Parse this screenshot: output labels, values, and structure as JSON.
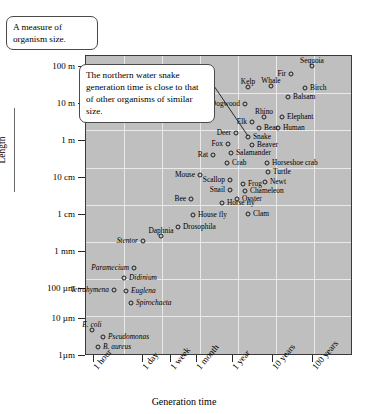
{
  "callouts": {
    "size_note": "A measure of organism size.",
    "snake_note": "The northern water snake generation time is close to that of other organisms of similar size."
  },
  "chart_data": {
    "type": "scatter",
    "title": "",
    "xlabel": "Generation time",
    "ylabel": "Length",
    "grid": true,
    "legend": "none",
    "xscale": "log",
    "yscale": "log",
    "xticks": [
      "1 hour",
      "1 day",
      "1 week",
      "1 month",
      "1 year",
      "10 years",
      "100 years"
    ],
    "yticks": [
      "100 m",
      "10 m",
      "1 m",
      "10 cm",
      "1 cm",
      "1 mm",
      "100 µm",
      "10 µm",
      "1µm"
    ],
    "points": [
      {
        "name": "Sequoia",
        "x": 312,
        "y": 66,
        "side": "above",
        "italic": false
      },
      {
        "name": "Fir",
        "x": 291,
        "y": 74,
        "side": "left",
        "italic": false
      },
      {
        "name": "Kelp",
        "x": 248,
        "y": 87,
        "side": "above",
        "italic": false
      },
      {
        "name": "Whale",
        "x": 271,
        "y": 86,
        "side": "above",
        "italic": false
      },
      {
        "name": "Birch",
        "x": 305,
        "y": 88,
        "side": "right",
        "italic": false
      },
      {
        "name": "Balsam",
        "x": 288,
        "y": 97,
        "side": "right",
        "italic": false
      },
      {
        "name": "Dogwood",
        "x": 245,
        "y": 104,
        "side": "left",
        "italic": false
      },
      {
        "name": "Rhino",
        "x": 264,
        "y": 117,
        "side": "above",
        "italic": false
      },
      {
        "name": "Elephant",
        "x": 282,
        "y": 117,
        "side": "right",
        "italic": false
      },
      {
        "name": "Elk",
        "x": 252,
        "y": 122,
        "side": "left",
        "italic": false
      },
      {
        "name": "Bear",
        "x": 259,
        "y": 128,
        "side": "right",
        "italic": false
      },
      {
        "name": "Human",
        "x": 278,
        "y": 128,
        "side": "right",
        "italic": false
      },
      {
        "name": "Deer",
        "x": 236,
        "y": 133,
        "side": "left",
        "italic": false
      },
      {
        "name": "Snake",
        "x": 248,
        "y": 137,
        "side": "right",
        "italic": false
      },
      {
        "name": "Beaver",
        "x": 252,
        "y": 145,
        "side": "right",
        "italic": false
      },
      {
        "name": "Fox",
        "x": 228,
        "y": 144,
        "side": "left",
        "italic": false
      },
      {
        "name": "Rat",
        "x": 213,
        "y": 155,
        "side": "left",
        "italic": false
      },
      {
        "name": "Salamander",
        "x": 231,
        "y": 153,
        "side": "right",
        "italic": false
      },
      {
        "name": "Crab",
        "x": 227,
        "y": 163,
        "side": "right",
        "italic": false
      },
      {
        "name": "Horseshoe crab",
        "x": 267,
        "y": 163,
        "side": "right",
        "italic": false
      },
      {
        "name": "Turtle",
        "x": 268,
        "y": 172,
        "side": "right",
        "italic": false
      },
      {
        "name": "Mouse",
        "x": 200,
        "y": 175,
        "side": "left",
        "italic": false
      },
      {
        "name": "Newt",
        "x": 265,
        "y": 182,
        "side": "right",
        "italic": false
      },
      {
        "name": "Scallop",
        "x": 230,
        "y": 180,
        "side": "left",
        "italic": false
      },
      {
        "name": "Frog",
        "x": 243,
        "y": 184,
        "side": "right",
        "italic": false
      },
      {
        "name": "Snail",
        "x": 230,
        "y": 190,
        "side": "left",
        "italic": false
      },
      {
        "name": "Chameleon",
        "x": 245,
        "y": 191,
        "side": "right",
        "italic": false
      },
      {
        "name": "Oyster",
        "x": 237,
        "y": 199,
        "side": "right",
        "italic": false
      },
      {
        "name": "Bee",
        "x": 191,
        "y": 199,
        "side": "left",
        "italic": false
      },
      {
        "name": "Horse fly",
        "x": 222,
        "y": 203,
        "side": "right",
        "italic": false
      },
      {
        "name": "House fly",
        "x": 193,
        "y": 215,
        "side": "right",
        "italic": false
      },
      {
        "name": "Clam",
        "x": 248,
        "y": 214,
        "side": "right",
        "italic": false
      },
      {
        "name": "Drosophila",
        "x": 178,
        "y": 227,
        "side": "right",
        "italic": false
      },
      {
        "name": "Daphnia",
        "x": 161,
        "y": 236,
        "side": "above",
        "italic": false
      },
      {
        "name": "Stentor",
        "x": 143,
        "y": 241,
        "side": "left",
        "italic": true
      },
      {
        "name": "Paramecium",
        "x": 134,
        "y": 268,
        "side": "left",
        "italic": true
      },
      {
        "name": "Didinium",
        "x": 124,
        "y": 278,
        "side": "right",
        "italic": true
      },
      {
        "name": "Tetrahymena",
        "x": 114,
        "y": 290,
        "side": "left",
        "italic": true
      },
      {
        "name": "Euglena",
        "x": 126,
        "y": 291,
        "side": "right",
        "italic": true
      },
      {
        "name": "Spirochaeta",
        "x": 131,
        "y": 303,
        "side": "right",
        "italic": true
      },
      {
        "name": "E. coli",
        "x": 92,
        "y": 330,
        "side": "above",
        "italic": true
      },
      {
        "name": "Pseudomonas",
        "x": 103,
        "y": 337,
        "side": "right",
        "italic": true
      },
      {
        "name": "B. aureus",
        "x": 98,
        "y": 347,
        "side": "right",
        "italic": true
      }
    ]
  }
}
